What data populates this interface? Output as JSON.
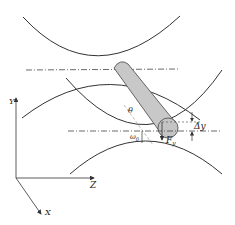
{
  "diagram": {
    "axes": {
      "y_label": "Y",
      "z_label": "Z",
      "x_label": "X"
    },
    "labels": {
      "theta": "θ",
      "delta_y": "Δy",
      "force": "F",
      "force_sub": "y",
      "omega": "ω",
      "omega_sub": "0"
    },
    "colors": {
      "stroke": "#333333",
      "particle_fill": "#c8c8c8",
      "particle_stroke": "#555555",
      "centerline": "#444444"
    }
  }
}
